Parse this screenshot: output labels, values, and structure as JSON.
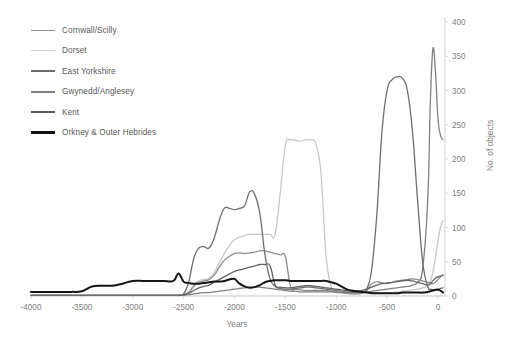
{
  "chart_data": {
    "type": "line",
    "title": "",
    "xlabel": "Years",
    "ylabel": "No. of objects",
    "xlim": [
      -4000,
      50
    ],
    "ylim": [
      0,
      400
    ],
    "xticks": [
      "-4000",
      "-3500",
      "-3000",
      "-2500",
      "-2000",
      "-1500",
      "-1000",
      "-500",
      "0"
    ],
    "xtick_values": [
      -4000,
      -3500,
      -3000,
      -2500,
      -2000,
      -1500,
      -1000,
      -500,
      0
    ],
    "yticks": [
      "0",
      "50",
      "100",
      "150",
      "200",
      "250",
      "300",
      "350",
      "400"
    ],
    "ytick_values": [
      0,
      50,
      100,
      150,
      200,
      250,
      300,
      350,
      400
    ],
    "grid": false,
    "legend_position": "top-left",
    "x": [
      -4000,
      -3900,
      -3800,
      -3700,
      -3600,
      -3500,
      -3400,
      -3300,
      -3200,
      -3100,
      -3000,
      -2900,
      -2800,
      -2700,
      -2600,
      -2550,
      -2500,
      -2450,
      -2400,
      -2350,
      -2300,
      -2250,
      -2200,
      -2150,
      -2100,
      -2050,
      -2000,
      -1950,
      -1900,
      -1850,
      -1800,
      -1750,
      -1700,
      -1650,
      -1600,
      -1550,
      -1500,
      -1450,
      -1400,
      -1350,
      -1300,
      -1250,
      -1200,
      -1150,
      -1100,
      -1050,
      -1000,
      -950,
      -900,
      -850,
      -800,
      -750,
      -700,
      -650,
      -600,
      -550,
      -500,
      -450,
      -400,
      -350,
      -300,
      -250,
      -200,
      -150,
      -100,
      -75,
      -50,
      -25,
      0,
      25,
      50
    ],
    "series": [
      {
        "name": "Cornwall/Scilly",
        "color": "#8c8c8c",
        "width": 1.3,
        "values": [
          1,
          1,
          1,
          1,
          1,
          1,
          1,
          1,
          1,
          1,
          1,
          1,
          1,
          1,
          1,
          1,
          2,
          5,
          14,
          20,
          22,
          24,
          30,
          42,
          52,
          58,
          62,
          63,
          62,
          63,
          64,
          66,
          66,
          64,
          62,
          60,
          58,
          14,
          10,
          9,
          8,
          8,
          8,
          8,
          8,
          7,
          6,
          5,
          4,
          3,
          3,
          4,
          8,
          18,
          21,
          19,
          18,
          20,
          22,
          23,
          24,
          25,
          24,
          22,
          20,
          19,
          18,
          20,
          24,
          28,
          31
        ]
      },
      {
        "name": "Dorset",
        "color": "#c8c8c8",
        "width": 1.3,
        "values": [
          1,
          1,
          1,
          1,
          1,
          1,
          1,
          1,
          1,
          1,
          1,
          1,
          1,
          1,
          1,
          1,
          2,
          6,
          16,
          22,
          24,
          26,
          34,
          48,
          62,
          74,
          82,
          86,
          88,
          90,
          90,
          90,
          90,
          90,
          90,
          150,
          220,
          228,
          227,
          226,
          228,
          228,
          222,
          180,
          60,
          14,
          6,
          5,
          5,
          5,
          5,
          5,
          5,
          5,
          5,
          5,
          5,
          5,
          6,
          7,
          8,
          9,
          10,
          12,
          16,
          22,
          35,
          55,
          80,
          100,
          110
        ]
      },
      {
        "name": "East Yorkshire",
        "color": "#6e6e6e",
        "width": 1.3,
        "values": [
          1,
          1,
          1,
          1,
          1,
          1,
          1,
          1,
          1,
          1,
          1,
          1,
          1,
          1,
          1,
          1,
          3,
          20,
          55,
          70,
          72,
          70,
          84,
          110,
          128,
          128,
          126,
          128,
          132,
          152,
          148,
          120,
          60,
          25,
          14,
          11,
          10,
          10,
          11,
          12,
          13,
          13,
          12,
          11,
          10,
          9,
          8,
          7,
          6,
          5,
          5,
          6,
          10,
          40,
          120,
          240,
          300,
          316,
          320,
          318,
          300,
          240,
          140,
          50,
          14,
          10,
          9,
          9,
          10,
          11,
          12
        ]
      },
      {
        "name": "Gwynedd/Anglesey",
        "color": "#808080",
        "width": 1.3,
        "values": [
          1,
          1,
          1,
          1,
          1,
          1,
          1,
          1,
          1,
          1,
          1,
          1,
          1,
          1,
          1,
          1,
          1,
          2,
          3,
          4,
          5,
          5,
          6,
          7,
          8,
          9,
          10,
          11,
          12,
          13,
          13,
          13,
          12,
          11,
          10,
          9,
          8,
          7,
          7,
          6,
          6,
          6,
          6,
          6,
          6,
          6,
          5,
          5,
          5,
          5,
          5,
          5,
          6,
          7,
          8,
          9,
          10,
          11,
          12,
          13,
          14,
          16,
          20,
          40,
          140,
          280,
          360,
          330,
          260,
          235,
          228
        ]
      },
      {
        "name": "Kent",
        "color": "#636363",
        "width": 1.3,
        "values": [
          1,
          1,
          1,
          1,
          1,
          1,
          1,
          1,
          1,
          1,
          1,
          1,
          1,
          1,
          1,
          1,
          2,
          4,
          8,
          12,
          14,
          16,
          20,
          24,
          28,
          32,
          36,
          38,
          40,
          42,
          44,
          46,
          46,
          44,
          16,
          13,
          12,
          12,
          13,
          14,
          15,
          15,
          14,
          13,
          12,
          11,
          10,
          9,
          8,
          7,
          7,
          8,
          10,
          13,
          16,
          18,
          19,
          20,
          21,
          22,
          23,
          22,
          20,
          18,
          16,
          18,
          22,
          26,
          28,
          29,
          30
        ]
      },
      {
        "name": "Orkney & Outer Hebrides",
        "color": "#151515",
        "width": 2.0,
        "values": [
          6,
          6,
          6,
          6,
          6,
          7,
          14,
          15,
          15,
          18,
          22,
          22,
          22,
          22,
          22,
          22,
          21,
          19,
          18,
          18,
          19,
          20,
          21,
          21,
          22,
          24,
          25,
          18,
          14,
          12,
          13,
          16,
          20,
          22,
          23,
          23,
          23,
          22,
          22,
          22,
          22,
          22,
          22,
          22,
          22,
          20,
          18,
          14,
          10,
          8,
          7,
          6,
          5,
          4,
          4,
          4,
          4,
          4,
          4,
          5,
          5,
          5,
          5,
          5,
          6,
          7,
          8,
          9,
          9,
          8,
          5
        ]
      }
    ],
    "orkney_extra_peak": {
      "x": -2550,
      "value": 33
    }
  },
  "legend": {
    "items": [
      {
        "label": "Cornwall/Scilly",
        "color": "#8c8c8c",
        "width": 1.6
      },
      {
        "label": "Dorset",
        "color": "#cfcfcf",
        "width": 1.8
      },
      {
        "label": "East Yorkshire",
        "color": "#6e6e6e",
        "width": 2.0
      },
      {
        "label": "Gwynedd/Anglesey",
        "color": "#7d7d7d",
        "width": 2.0
      },
      {
        "label": "Kent",
        "color": "#5c5c5c",
        "width": 2.4
      },
      {
        "label": "Orkney & Outer Hebrides",
        "color": "#111111",
        "width": 3.0
      }
    ]
  },
  "axes": {
    "x_title": "Years",
    "y_title": "No. of objects",
    "axis_color": "#d9d9d9",
    "tick_color": "#808080"
  }
}
